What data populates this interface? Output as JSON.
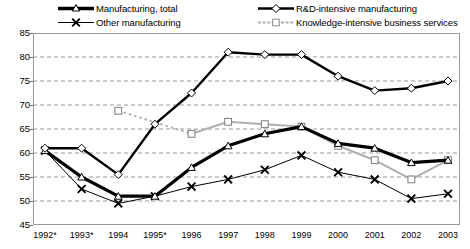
{
  "chart_data": {
    "type": "line",
    "title": "",
    "subtitle": "",
    "xlabel": "",
    "ylabel": "",
    "ylim": [
      45,
      85
    ],
    "yticks": [
      45,
      50,
      55,
      60,
      65,
      70,
      75,
      80,
      85
    ],
    "grid": true,
    "legend_position": "top",
    "categories": [
      "1992*",
      "1993*",
      "1994",
      "1995*",
      "1996",
      "1997",
      "1998",
      "1999",
      "2000",
      "2001",
      "2002",
      "2003"
    ],
    "series": [
      {
        "name": "Manufacturing, total",
        "marker": "triangle",
        "color": "#000000",
        "line_width": 3.2,
        "values": [
          60.5,
          55.0,
          51.0,
          51.0,
          57.0,
          61.5,
          64.0,
          65.5,
          62.0,
          61.0,
          58.0,
          58.5
        ]
      },
      {
        "name": "Other manufacturing",
        "marker": "cross",
        "color": "#000000",
        "line_width": 1,
        "values": [
          60.5,
          52.5,
          49.5,
          51.0,
          53.0,
          54.5,
          56.5,
          59.5,
          56.0,
          54.5,
          50.5,
          51.5
        ]
      },
      {
        "name": "R&D-intensive manufacturing",
        "marker": "diamond",
        "color": "#000000",
        "line_width": 2.4,
        "values": [
          61.0,
          61.0,
          55.5,
          66.0,
          72.5,
          81.0,
          80.5,
          80.5,
          76.0,
          73.0,
          73.5,
          75.0
        ]
      },
      {
        "name": "Knowledge-intensive business services",
        "marker": "square",
        "color": "#b0b0b0",
        "line_width": 2,
        "values": [
          null,
          null,
          68.8,
          null,
          64.0,
          66.5,
          66.0,
          65.5,
          61.5,
          58.5,
          54.5,
          58.5
        ]
      }
    ],
    "legend": [
      {
        "label": "Manufacturing, total",
        "marker": "triangle",
        "color": "#000000",
        "style": "thick"
      },
      {
        "label": "Other manufacturing",
        "marker": "cross",
        "color": "#000000",
        "style": "thin"
      },
      {
        "label": "R&D-intensive manufacturing",
        "marker": "diamond",
        "color": "#000000",
        "style": "medium"
      },
      {
        "label": "Knowledge-intensive business services",
        "marker": "square",
        "color": "#b0b0b0",
        "style": "gray"
      }
    ]
  }
}
